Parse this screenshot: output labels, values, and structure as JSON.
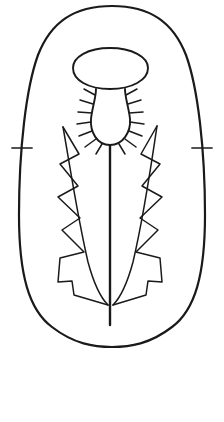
{
  "canvas": {
    "width": 224,
    "height": 422,
    "background_color": "#ffffff",
    "ink_color": "#1a1a1a",
    "title": "Thistle Flower Line Drawing"
  },
  "artwork": {
    "type": "line-art-outline",
    "subject": "thistle-plant",
    "style": "coloring-page-outline",
    "parts": [
      {
        "id": "outer-capsule",
        "label": "Outer Capsule Border"
      },
      {
        "id": "flower-head",
        "label": "Flower Head Ellipse"
      },
      {
        "id": "calyx-bulb",
        "label": "Spiny Calyx Bulb"
      },
      {
        "id": "calyx-spines",
        "label": "Calyx Spines"
      },
      {
        "id": "stem",
        "label": "Central Stem"
      },
      {
        "id": "left-leaf",
        "label": "Left Serrated Leaf"
      },
      {
        "id": "right-leaf",
        "label": "Right Serrated Leaf"
      },
      {
        "id": "left-tick",
        "label": "Left Edge Tick Mark"
      },
      {
        "id": "right-tick",
        "label": "Right Edge Tick Mark"
      }
    ]
  },
  "geometry": {
    "outer_capsule_path": "M 112 6 C 150 6 173 22 186 55 C 198 88 205 150 205 215 C 205 275 195 310 172 327 C 150 344 130 347 112 347 C 94 347 74 344 52 327 C 29 310 19 275 19 215 C 19 150 26 88 38 55 C 51 22 74 6 112 6 Z",
    "flower_head_path": "M 110 48 C 132 48 148 57 148 68 C 148 80 132 89 110 89 C 88 89 73 80 73 68 C 73 57 88 48 110 48 Z",
    "calyx_bulb_path": "M 96 89 C 96 98 92 108 91 119 C 90 132 97 145 110 145 C 123 145 131 132 130 119 C 129 108 125 98 125 89",
    "calyx_neck_left": "M 96 89 L 96 91",
    "calyx_neck_right": "M 125 89 L 125 91",
    "stem_path": "M 110 145 L 110 325",
    "left_leaf_inner_path": "M 63 127 C 69 160 77 215 88 262 C 95 288 102 299 108 305",
    "left_leaf_outer_path": "M 63 127 L 79 154 L 60 164 L 78 186 L 58 197 L 80 218 L 62 230 L 84 252 L 60 258 L 58 282 L 72 281 L 74 295 L 108 305",
    "right_leaf_inner_path": "M 157 126 C 152 160 144 215 133 262 C 126 288 119 299 113 305",
    "right_leaf_outer_path": "M 157 126 L 141 154 L 160 164 L 142 186 L 162 197 L 140 218 L 158 230 L 136 252 L 160 258 L 162 282 L 148 281 L 146 295 L 113 305",
    "left_tick": "M 12 148 L 32 148",
    "right_tick": "M 192 148 L 212 148",
    "spines_left": [
      "M 95 95 L 84 89",
      "M 93 104 L 80 100",
      "M 92 113 L 78 112",
      "M 91 122 L 77 124",
      "M 92 131 L 79 136",
      "M 96 139 L 85 147",
      "M 102 144 L 96 154"
    ],
    "spines_right": [
      "M 126 95 L 137 89",
      "M 128 104 L 141 100",
      "M 129 113 L 143 112",
      "M 130 122 L 144 124",
      "M 129 131 L 142 136",
      "M 125 139 L 136 147",
      "M 119 144 L 125 154"
    ]
  }
}
